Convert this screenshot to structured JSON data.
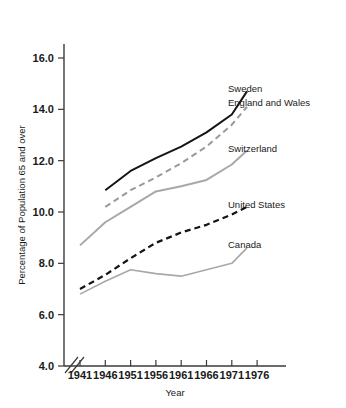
{
  "chart_data": {
    "type": "line",
    "title": "",
    "xlabel": "Year",
    "ylabel": "Percentage of Population 65 and over",
    "x": [
      1941,
      1946,
      1951,
      1956,
      1961,
      1966,
      1971,
      1976
    ],
    "xtick_labels": [
      "1941",
      "1946",
      "1951",
      "1956",
      "1961",
      "1966",
      "1971",
      "1976"
    ],
    "ytick_labels": [
      "4.0",
      "6.0",
      "8.0",
      "10.0",
      "12.0",
      "14.0",
      "16.0"
    ],
    "ytick_values": [
      4.0,
      6.0,
      8.0,
      10.0,
      12.0,
      14.0,
      16.0
    ],
    "ylim": [
      4.0,
      16.8
    ],
    "xlim": [
      1939.2,
      1978.5
    ],
    "grid": false,
    "axis_break": true,
    "legend_position": "right-inline-labels",
    "series": [
      {
        "name": "Sweden",
        "label": "Sweden",
        "color": "#141414",
        "style": "solid",
        "width": 2.0,
        "x": [
          1946,
          1951,
          1956,
          1961,
          1966,
          1971,
          1974
        ],
        "values": [
          10.85,
          11.6,
          12.1,
          12.55,
          13.1,
          13.8,
          14.7
        ]
      },
      {
        "name": "England and Wales",
        "label": "England and Wales",
        "color": "#9a9a9a",
        "style": "dashed",
        "width": 2.0,
        "x": [
          1946,
          1951,
          1956,
          1961,
          1966,
          1971,
          1974
        ],
        "values": [
          10.2,
          10.85,
          11.35,
          11.9,
          12.55,
          13.4,
          14.1
        ]
      },
      {
        "name": "Switzerland",
        "label": "Switzerland",
        "color": "#a8a8a8",
        "style": "solid",
        "width": 2.0,
        "x": [
          1941,
          1946,
          1951,
          1956,
          1961,
          1966,
          1971,
          1974
        ],
        "values": [
          8.7,
          9.6,
          10.2,
          10.8,
          11.0,
          11.25,
          11.85,
          12.4
        ]
      },
      {
        "name": "United States",
        "label": "United States",
        "color": "#141414",
        "style": "dashed",
        "width": 2.2,
        "x": [
          1941,
          1946,
          1951,
          1956,
          1961,
          1966,
          1971,
          1974
        ],
        "values": [
          7.0,
          7.55,
          8.2,
          8.8,
          9.2,
          9.5,
          9.9,
          10.2
        ]
      },
      {
        "name": "Canada",
        "label": "Canada",
        "color": "#a8a8a8",
        "style": "solid",
        "width": 1.6,
        "x": [
          1941,
          1946,
          1951,
          1956,
          1961,
          1966,
          1971,
          1974
        ],
        "values": [
          6.8,
          7.3,
          7.75,
          7.6,
          7.5,
          7.75,
          8.0,
          8.6
        ]
      }
    ],
    "annotations": [
      {
        "text": "Sweden",
        "x_px": 228,
        "y_px": 92
      },
      {
        "text": "England and Wales",
        "x_px": 228,
        "y_px": 106
      },
      {
        "text": "Switzerland",
        "x_px": 228,
        "y_px": 152
      },
      {
        "text": "United States",
        "x_px": 228,
        "y_px": 208
      },
      {
        "text": "Canada",
        "x_px": 228,
        "y_px": 248
      }
    ]
  }
}
